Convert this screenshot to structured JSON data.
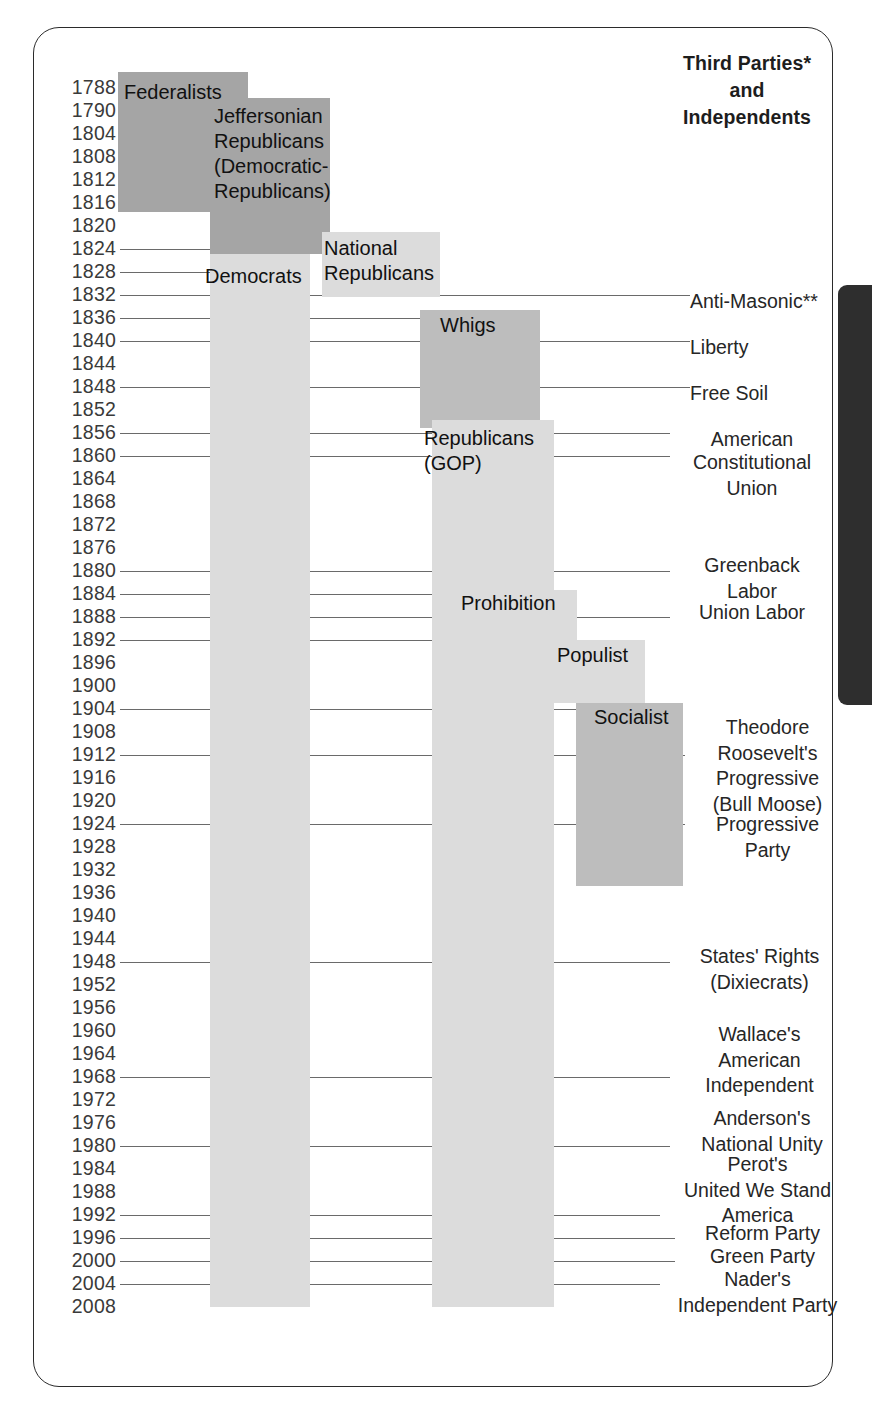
{
  "figure": {
    "heading_lines": [
      "Third Parties*",
      "and",
      "Independents"
    ]
  },
  "chart_data": {
    "type": "timeline",
    "ylabel": "Election Year",
    "axis_years": [
      1788,
      1790,
      1804,
      1808,
      1812,
      1816,
      1820,
      1824,
      1828,
      1832,
      1836,
      1840,
      1844,
      1848,
      1852,
      1856,
      1860,
      1864,
      1868,
      1872,
      1876,
      1880,
      1884,
      1888,
      1892,
      1896,
      1900,
      1904,
      1908,
      1912,
      1916,
      1920,
      1924,
      1928,
      1932,
      1936,
      1940,
      1944,
      1948,
      1952,
      1956,
      1960,
      1964,
      1968,
      1972,
      1976,
      1980,
      1984,
      1988,
      1992,
      1996,
      2000,
      2004,
      2008
    ],
    "major_parties": [
      {
        "name": "Federalists",
        "start_year": 1788,
        "end_year": 1816,
        "tone": "tone-dark"
      },
      {
        "name": "Jeffersonian Republicans (Democratic-Republicans)",
        "start_year": 1790,
        "end_year": 1824,
        "tone": "tone-dark"
      },
      {
        "name": "Democrats",
        "start_year": 1828,
        "end_year": 2008,
        "tone": "tone-light"
      },
      {
        "name": "National Republicans",
        "start_year": 1824,
        "end_year": 1832,
        "tone": "tone-light"
      },
      {
        "name": "Whigs",
        "start_year": 1834,
        "end_year": 1854,
        "tone": "tone-mid"
      },
      {
        "name": "Republicans (GOP)",
        "start_year": 1854,
        "end_year": 2008,
        "tone": "tone-light"
      },
      {
        "name": "Prohibition",
        "start_year": 1882,
        "end_year": 1890,
        "tone": "tone-light"
      },
      {
        "name": "Populist",
        "start_year": 1890,
        "end_year": 1900,
        "tone": "tone-light"
      },
      {
        "name": "Socialist",
        "start_year": 1900,
        "end_year": 1932,
        "tone": "tone-mid"
      }
    ],
    "third_parties": [
      {
        "label": "Anti-Masonic**",
        "year": 1832
      },
      {
        "label": "Liberty",
        "year": 1840
      },
      {
        "label": "Free Soil",
        "year": 1848
      },
      {
        "label": "American",
        "year": 1856
      },
      {
        "label": "Constitutional Union",
        "year": 1860
      },
      {
        "label": "Greenback Labor",
        "year": 1880
      },
      {
        "label": "Union Labor",
        "year": 1888
      },
      {
        "label": "Theodore Roosevelt's Progressive (Bull Moose)",
        "year": 1912
      },
      {
        "label": "Progressive Party",
        "year": 1924
      },
      {
        "label": "States' Rights (Dixiecrats)",
        "year": 1948
      },
      {
        "label": "Wallace's American Independent",
        "year": 1968
      },
      {
        "label": "Anderson's National Unity",
        "year": 1980
      },
      {
        "label": "Perot's United We Stand America",
        "year": 1992
      },
      {
        "label": "Reform Party",
        "year": 1996
      },
      {
        "label": "Green Party",
        "year": 2000
      },
      {
        "label": "Nader's Independent Party",
        "year": 2004
      }
    ]
  },
  "years": [
    {
      "y": 1788,
      "top": 78
    },
    {
      "y": 1790,
      "top": 101
    },
    {
      "y": 1804,
      "top": 124
    },
    {
      "y": 1808,
      "top": 147
    },
    {
      "y": 1812,
      "top": 170
    },
    {
      "y": 1816,
      "top": 193
    },
    {
      "y": 1820,
      "top": 216
    },
    {
      "y": 1824,
      "top": 239
    },
    {
      "y": 1828,
      "top": 262
    },
    {
      "y": 1832,
      "top": 285
    },
    {
      "y": 1836,
      "top": 308
    },
    {
      "y": 1840,
      "top": 331
    },
    {
      "y": 1844,
      "top": 354
    },
    {
      "y": 1848,
      "top": 377
    },
    {
      "y": 1852,
      "top": 400
    },
    {
      "y": 1856,
      "top": 423
    },
    {
      "y": 1860,
      "top": 446
    },
    {
      "y": 1864,
      "top": 469
    },
    {
      "y": 1868,
      "top": 492
    },
    {
      "y": 1872,
      "top": 515
    },
    {
      "y": 1876,
      "top": 538
    },
    {
      "y": 1880,
      "top": 561
    },
    {
      "y": 1884,
      "top": 584
    },
    {
      "y": 1888,
      "top": 607
    },
    {
      "y": 1892,
      "top": 630
    },
    {
      "y": 1896,
      "top": 653
    },
    {
      "y": 1900,
      "top": 676
    },
    {
      "y": 1904,
      "top": 699
    },
    {
      "y": 1908,
      "top": 722
    },
    {
      "y": 1912,
      "top": 745
    },
    {
      "y": 1916,
      "top": 768
    },
    {
      "y": 1920,
      "top": 791
    },
    {
      "y": 1924,
      "top": 814
    },
    {
      "y": 1928,
      "top": 837
    },
    {
      "y": 1932,
      "top": 860
    },
    {
      "y": 1936,
      "top": 883
    },
    {
      "y": 1940,
      "top": 906
    },
    {
      "y": 1944,
      "top": 929
    },
    {
      "y": 1948,
      "top": 952
    },
    {
      "y": 1952,
      "top": 975
    },
    {
      "y": 1956,
      "top": 998
    },
    {
      "y": 1960,
      "top": 1021
    },
    {
      "y": 1964,
      "top": 1044
    },
    {
      "y": 1968,
      "top": 1067
    },
    {
      "y": 1972,
      "top": 1090
    },
    {
      "y": 1976,
      "top": 1113
    },
    {
      "y": 1980,
      "top": 1136
    },
    {
      "y": 1984,
      "top": 1159
    },
    {
      "y": 1988,
      "top": 1182
    },
    {
      "y": 1992,
      "top": 1205
    },
    {
      "y": 1996,
      "top": 1228
    },
    {
      "y": 2000,
      "top": 1251
    },
    {
      "y": 2004,
      "top": 1274
    },
    {
      "y": 2008,
      "top": 1297
    }
  ],
  "blocks": [
    {
      "name": "federalists",
      "left": 118,
      "top": 72,
      "width": 130,
      "height": 140,
      "tone": "tone-dark"
    },
    {
      "name": "jeffersonian",
      "left": 210,
      "top": 98,
      "width": 120,
      "height": 156,
      "tone": "tone-dark"
    },
    {
      "name": "democrats",
      "left": 210,
      "top": 254,
      "width": 100,
      "height": 1053,
      "tone": "tone-light"
    },
    {
      "name": "national-republicans",
      "left": 322,
      "top": 232,
      "width": 118,
      "height": 65,
      "tone": "tone-light"
    },
    {
      "name": "whigs",
      "left": 420,
      "top": 310,
      "width": 120,
      "height": 118,
      "tone": "tone-mid"
    },
    {
      "name": "republicans-gop",
      "left": 432,
      "top": 420,
      "width": 122,
      "height": 887,
      "tone": "tone-light"
    },
    {
      "name": "prohibition",
      "left": 480,
      "top": 590,
      "width": 97,
      "height": 50,
      "tone": "tone-light"
    },
    {
      "name": "populist",
      "left": 540,
      "top": 640,
      "width": 105,
      "height": 63,
      "tone": "tone-light"
    },
    {
      "name": "socialist",
      "left": 576,
      "top": 703,
      "width": 107,
      "height": 183,
      "tone": "tone-mid"
    }
  ],
  "block_labels": [
    {
      "name": "federalists-label",
      "text": "Federalists",
      "left": 124,
      "top": 80,
      "width": 0
    },
    {
      "name": "jeffersonian-label",
      "text": "Jeffersonian\nRepublicans\n(Democratic-\nRepublicans)",
      "left": 214,
      "top": 104,
      "width": 124
    },
    {
      "name": "democrats-label",
      "text": "Democrats",
      "left": 205,
      "top": 264,
      "width": 0
    },
    {
      "name": "national-republicans-label",
      "text": "National\nRepublicans",
      "left": 324,
      "top": 236,
      "width": 120
    },
    {
      "name": "whigs-label",
      "text": "Whigs",
      "left": 440,
      "top": 313,
      "width": 0
    },
    {
      "name": "republicans-label",
      "text": "Republicans\n(GOP)",
      "left": 424,
      "top": 426,
      "width": 136
    },
    {
      "name": "prohibition-label",
      "text": "Prohibition",
      "left": 461,
      "top": 591,
      "width": 0
    },
    {
      "name": "populist-label",
      "text": "Populist",
      "left": 557,
      "top": 643,
      "width": 0
    },
    {
      "name": "socialist-label",
      "text": "Socialist",
      "left": 594,
      "top": 705,
      "width": 0
    }
  ],
  "third_party_labels": [
    {
      "name": "anti-masonic",
      "text": "Anti-Masonic**",
      "left": 690,
      "top": 289,
      "width": 160,
      "align": "left"
    },
    {
      "name": "liberty",
      "text": "Liberty",
      "left": 690,
      "top": 335,
      "width": 160,
      "align": "left"
    },
    {
      "name": "free-soil",
      "text": "Free Soil",
      "left": 690,
      "top": 381,
      "width": 160,
      "align": "left"
    },
    {
      "name": "american",
      "text": "American",
      "left": 672,
      "top": 427,
      "width": 160,
      "align": "center"
    },
    {
      "name": "constitutional-union",
      "text": "Constitutional\nUnion",
      "left": 672,
      "top": 450,
      "width": 160,
      "align": "center"
    },
    {
      "name": "greenback-labor",
      "text": "Greenback\nLabor",
      "left": 672,
      "top": 553,
      "width": 160,
      "align": "center"
    },
    {
      "name": "union-labor",
      "text": "Union Labor",
      "left": 672,
      "top": 600,
      "width": 160,
      "align": "center"
    },
    {
      "name": "tr-progressive",
      "text": "Theodore\nRoosevelt's\nProgressive\n(Bull Moose)",
      "left": 685,
      "top": 715,
      "width": 165,
      "align": "center"
    },
    {
      "name": "progressive-party",
      "text": "Progressive\nParty",
      "left": 685,
      "top": 812,
      "width": 165,
      "align": "center"
    },
    {
      "name": "states-rights",
      "text": "States' Rights\n(Dixiecrats)",
      "left": 672,
      "top": 944,
      "width": 175,
      "align": "center"
    },
    {
      "name": "wallace",
      "text": "Wallace's\nAmerican\nIndependent",
      "left": 672,
      "top": 1022,
      "width": 175,
      "align": "center"
    },
    {
      "name": "anderson",
      "text": "Anderson's\nNational Unity",
      "left": 672,
      "top": 1106,
      "width": 180,
      "align": "center"
    },
    {
      "name": "perot",
      "text": "Perot's\nUnited We Stand\nAmerica",
      "left": 660,
      "top": 1152,
      "width": 195,
      "align": "center"
    },
    {
      "name": "reform-party",
      "text": "Reform Party",
      "left": 675,
      "top": 1221,
      "width": 175,
      "align": "center"
    },
    {
      "name": "green-party",
      "text": "Green Party",
      "left": 675,
      "top": 1244,
      "width": 175,
      "align": "center"
    },
    {
      "name": "naders",
      "text": "Nader's\nIndependent Party",
      "left": 660,
      "top": 1267,
      "width": 195,
      "align": "center"
    }
  ],
  "rules": [
    {
      "name": "rule-1788",
      "left": 120,
      "top": 88,
      "width": 30
    },
    {
      "name": "rule-1790",
      "left": 120,
      "top": 111,
      "width": 100
    },
    {
      "name": "rule-1824",
      "left": 120,
      "top": 249,
      "width": 210
    },
    {
      "name": "rule-1828",
      "left": 120,
      "top": 272,
      "width": 94
    },
    {
      "name": "rule-1832",
      "left": 120,
      "top": 295,
      "width": 570
    },
    {
      "name": "rule-1836",
      "left": 120,
      "top": 318,
      "width": 320
    },
    {
      "name": "rule-1840",
      "left": 120,
      "top": 341,
      "width": 570
    },
    {
      "name": "rule-1848",
      "left": 120,
      "top": 387,
      "width": 570
    },
    {
      "name": "rule-1856",
      "left": 120,
      "top": 433,
      "width": 550
    },
    {
      "name": "rule-1860",
      "left": 120,
      "top": 456,
      "width": 550
    },
    {
      "name": "rule-1880",
      "left": 120,
      "top": 571,
      "width": 550
    },
    {
      "name": "rule-1884",
      "left": 120,
      "top": 594,
      "width": 340
    },
    {
      "name": "rule-1888",
      "left": 120,
      "top": 617,
      "width": 550
    },
    {
      "name": "rule-1892",
      "left": 120,
      "top": 640,
      "width": 437
    },
    {
      "name": "rule-1904",
      "left": 120,
      "top": 709,
      "width": 474
    },
    {
      "name": "rule-1912",
      "left": 120,
      "top": 755,
      "width": 565
    },
    {
      "name": "rule-1924",
      "left": 120,
      "top": 824,
      "width": 565
    },
    {
      "name": "rule-1948",
      "left": 120,
      "top": 962,
      "width": 550
    },
    {
      "name": "rule-1968",
      "left": 120,
      "top": 1077,
      "width": 550
    },
    {
      "name": "rule-1980",
      "left": 120,
      "top": 1146,
      "width": 550
    },
    {
      "name": "rule-1992",
      "left": 120,
      "top": 1215,
      "width": 540
    },
    {
      "name": "rule-1996",
      "left": 120,
      "top": 1238,
      "width": 555
    },
    {
      "name": "rule-2000",
      "left": 120,
      "top": 1261,
      "width": 555
    },
    {
      "name": "rule-2004",
      "left": 120,
      "top": 1284,
      "width": 540
    }
  ]
}
